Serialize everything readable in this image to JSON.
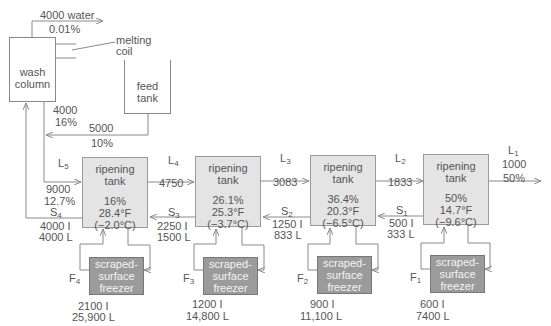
{
  "diagram": {
    "type": "freeze-concentration flow diagram",
    "wash_column": {
      "label_line1": "wash",
      "label_line2": "column",
      "water_out": "4000 water",
      "water_out_conc": "0.01%",
      "melting_coil_line1": "melting",
      "melting_coil_line2": "coil",
      "outflow": "4000",
      "outflow_conc": "16%"
    },
    "feed_tank": {
      "label_line1": "feed",
      "label_line2": "tank",
      "flow": "5000",
      "conc": "10%"
    },
    "tanks": [
      {
        "name_line1": "ripening",
        "name_line2": "tank",
        "conc": "16%",
        "temp_f": "28.4°F",
        "temp_c": "(−2.0°C)"
      },
      {
        "name_line1": "ripening",
        "name_line2": "tank",
        "conc": "26.1%",
        "temp_f": "25.3°F",
        "temp_c": "(−3.7°C)"
      },
      {
        "name_line1": "ripening",
        "name_line2": "tank",
        "conc": "36.4%",
        "temp_f": "20.3°F",
        "temp_c": "(−6.5°C)"
      },
      {
        "name_line1": "ripening",
        "name_line2": "tank",
        "conc": "50%",
        "temp_f": "14.7°F",
        "temp_c": "(−9.6°C)"
      }
    ],
    "liquid_streams": [
      {
        "id": "L",
        "sub": "5",
        "value": "9000",
        "conc": "12.7%"
      },
      {
        "id": "L",
        "sub": "4",
        "value": "4750"
      },
      {
        "id": "L",
        "sub": "3",
        "value": "3083"
      },
      {
        "id": "L",
        "sub": "2",
        "value": "1833"
      },
      {
        "id": "L",
        "sub": "1",
        "value": "1000",
        "conc": "50%"
      }
    ],
    "solid_streams": [
      {
        "id": "S",
        "sub": "4",
        "ice": "4000 I",
        "liquid": "4000 L"
      },
      {
        "id": "S",
        "sub": "3",
        "ice": "2250 I",
        "liquid": "1500 L"
      },
      {
        "id": "S",
        "sub": "2",
        "ice": "1250 I",
        "liquid": "833 L"
      },
      {
        "id": "S",
        "sub": "1",
        "ice": "500 I",
        "liquid": "333 L"
      }
    ],
    "freezers": [
      {
        "id": "F",
        "sub": "4",
        "line1": "scraped-",
        "line2": "surface",
        "line3": "freezer",
        "ice": "2100 I",
        "liquid": "25,900 L"
      },
      {
        "id": "F",
        "sub": "3",
        "line1": "scraped-",
        "line2": "surface",
        "line3": "freezer",
        "ice": "1200 I",
        "liquid": "14,800 L"
      },
      {
        "id": "F",
        "sub": "2",
        "line1": "scraped-",
        "line2": "surface",
        "line3": "freezer",
        "ice": "900 I",
        "liquid": "11,100 L"
      },
      {
        "id": "F",
        "sub": "1",
        "line1": "scraped-",
        "line2": "surface",
        "line3": "freezer",
        "ice": "600 I",
        "liquid": "7400 L"
      }
    ],
    "colors": {
      "tank_fill": "#e4e4e4",
      "freezer_fill": "#9b9b9b",
      "line": "#8a8a8a",
      "text": "#555555"
    }
  }
}
